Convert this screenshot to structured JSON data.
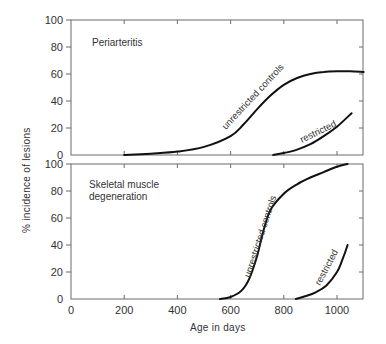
{
  "chart_data": [
    {
      "type": "line",
      "title": "Periarteritis",
      "xlabel": "Age in days",
      "ylabel": "% incidence of lesions",
      "xlim": [
        0,
        1100
      ],
      "ylim": [
        0,
        100
      ],
      "xticks": [
        0,
        200,
        400,
        600,
        800,
        1000
      ],
      "yticks": [
        0,
        20,
        40,
        60,
        80,
        100
      ],
      "grid": false,
      "legend": "inline curve labels",
      "series": [
        {
          "name": "unrestricted controls",
          "x": [
            200,
            300,
            400,
            500,
            600,
            650,
            700,
            750,
            800,
            850,
            900,
            950,
            1000,
            1050,
            1100
          ],
          "y": [
            0,
            1,
            2.5,
            6,
            14,
            23,
            34,
            44,
            52,
            57,
            60,
            61.5,
            62,
            62,
            61.5
          ]
        },
        {
          "name": "restricted",
          "x": [
            760,
            800,
            850,
            900,
            950,
            1000,
            1055
          ],
          "y": [
            0,
            1.5,
            4,
            8,
            14,
            21,
            31
          ]
        }
      ]
    },
    {
      "type": "line",
      "title": "Skeletal muscle degeneration",
      "xlabel": "Age in days",
      "ylabel": "% incidence of lesions",
      "xlim": [
        0,
        1100
      ],
      "ylim": [
        0,
        100
      ],
      "xticks": [
        0,
        200,
        400,
        600,
        800,
        1000
      ],
      "yticks": [
        0,
        20,
        40,
        60,
        80,
        100
      ],
      "grid": false,
      "legend": "inline curve labels",
      "series": [
        {
          "name": "unrestricted controls",
          "x": [
            560,
            600,
            640,
            670,
            700,
            720,
            750,
            800,
            850,
            900,
            950,
            1000,
            1040
          ],
          "y": [
            0,
            1.5,
            6,
            15,
            32,
            48,
            66,
            78,
            85,
            90,
            94,
            98,
            100
          ]
        },
        {
          "name": "restricted",
          "x": [
            845,
            880,
            920,
            960,
            1000,
            1020,
            1040
          ],
          "y": [
            0,
            2,
            5,
            10,
            20,
            29,
            40
          ]
        }
      ]
    }
  ],
  "labels": {
    "ylabel": "% incidence of lesions",
    "xlabel": "Age in days",
    "top_title": "Periarteritis",
    "bottom_title_line1": "Skeletal muscle",
    "bottom_title_line2": "degeneration",
    "unrestricted": "unrestricted controls",
    "restricted": "restricted"
  },
  "ticks": {
    "x": [
      "0",
      "200",
      "400",
      "600",
      "800",
      "1000"
    ],
    "y": [
      "0",
      "20",
      "40",
      "60",
      "80",
      "100"
    ]
  }
}
